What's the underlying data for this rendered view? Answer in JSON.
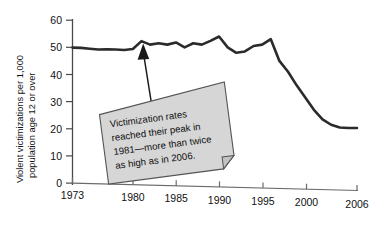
{
  "chart_data": {
    "type": "line",
    "title": "",
    "xlabel": "",
    "ylabel_line1": "Violent victimizations per 1,000",
    "ylabel_line2": "population age 12 or over",
    "xlim": [
      1973,
      2006
    ],
    "ylim": [
      0,
      60
    ],
    "grid": false,
    "legend": "none",
    "x_tick_labels": [
      "1973",
      "1980",
      "1985",
      "1990",
      "1995",
      "2000",
      "2006"
    ],
    "x_ticks": [
      1973,
      1980,
      1985,
      1990,
      1995,
      2000,
      2006
    ],
    "y_tick_labels": [
      "0",
      "10",
      "20",
      "30",
      "40",
      "50",
      "60"
    ],
    "y_ticks": [
      0,
      10,
      20,
      30,
      40,
      50,
      60
    ],
    "series": [
      {
        "name": "Violent victimization rate",
        "color": "#2b2b2b",
        "x": [
          1973,
          1974,
          1975,
          1976,
          1977,
          1978,
          1979,
          1980,
          1981,
          1982,
          1983,
          1984,
          1985,
          1986,
          1987,
          1988,
          1989,
          1990,
          1991,
          1992,
          1993,
          1994,
          1995,
          1996,
          1997,
          1998,
          1999,
          2000,
          2001,
          2002,
          2003,
          2004,
          2005,
          2006
        ],
        "values": [
          49.9,
          49.8,
          49.5,
          49.2,
          49.3,
          49.2,
          49.0,
          49.4,
          52.3,
          51.0,
          51.5,
          51.0,
          51.8,
          50.0,
          51.5,
          51.0,
          52.4,
          54.0,
          50.0,
          48.0,
          48.5,
          50.5,
          51.0,
          53.0,
          45.0,
          41.0,
          36.0,
          31.5,
          27.0,
          23.5,
          21.5,
          20.5,
          20.3,
          20.3
        ]
      }
    ],
    "annotations": [
      {
        "name": "peak-callout",
        "text_lines": [
          "Victimization rates",
          "reached their peak in",
          "1981—more than twice",
          "as high as in 2006."
        ],
        "points_to_year": 1981,
        "points_to_value": 54,
        "box_fill": "#d6d6d6",
        "box_stroke": "#555555"
      }
    ]
  }
}
